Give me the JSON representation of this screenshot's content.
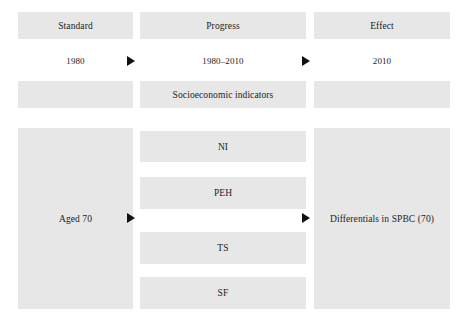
{
  "figure": {
    "type": "flow-diagram",
    "background_color": "#ffffff",
    "box_fill_color": "#e7e7e7",
    "text_color": "#1c1c1c",
    "arrow_color": "#111111"
  },
  "columns": {
    "left": {
      "header": "Standard",
      "period": "1980",
      "spacer": "",
      "panel": "Aged 70"
    },
    "middle": {
      "header": "Progress",
      "period": "1980–2010",
      "group_label": "Socioeconomic indicators",
      "indicators": [
        {
          "label": "NI"
        },
        {
          "label": "PEH"
        },
        {
          "label": "TS"
        },
        {
          "label": "SF"
        }
      ]
    },
    "right": {
      "header": "Effect",
      "period": "2010",
      "spacer": "",
      "panel": "Differentials in SPBC (70)"
    }
  },
  "connectors": [
    {
      "name": "arrow-top-left-to-middle",
      "glyph": "right-triangle"
    },
    {
      "name": "arrow-top-middle-to-right",
      "glyph": "right-triangle"
    },
    {
      "name": "arrow-bottom-left-to-middle",
      "glyph": "right-triangle"
    },
    {
      "name": "arrow-bottom-middle-to-right",
      "glyph": "right-triangle"
    }
  ]
}
